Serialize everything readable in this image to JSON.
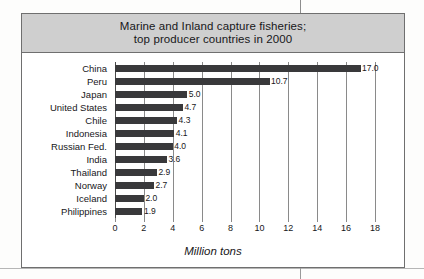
{
  "figure": {
    "title_line1": "Marine and Inland capture fisheries;",
    "title_line2": "top producer countries in 2000",
    "frame_color": "#6f6f6f",
    "title_band_color": "#cfcfcf",
    "bar_color": "#39393b"
  },
  "chart_data": {
    "type": "bar",
    "orientation": "horizontal",
    "title": "Marine and Inland capture fisheries; top producer countries in 2000",
    "xlabel": "Million tons",
    "ylabel": "",
    "categories": [
      "China",
      "Peru",
      "Japan",
      "United States",
      "Chile",
      "Indonesia",
      "Russian Fed.",
      "India",
      "Thailand",
      "Norway",
      "Iceland",
      "Philippines"
    ],
    "values": [
      17.0,
      10.7,
      5.0,
      4.7,
      4.3,
      4.1,
      4.0,
      3.6,
      2.9,
      2.7,
      2.0,
      1.9
    ],
    "value_labels": [
      "17.0",
      "10.7",
      "5.0",
      "4.7",
      "4.3",
      "4.1",
      "4.0",
      "3.6",
      "2.9",
      "2.7",
      "2.0",
      "1.9"
    ],
    "xlim": [
      0,
      18
    ],
    "xticks": [
      0,
      2,
      4,
      6,
      8,
      10,
      12,
      14,
      16,
      18
    ],
    "xtick_labels": [
      "0",
      "2",
      "4",
      "6",
      "8",
      "10",
      "12",
      "14",
      "16",
      "18"
    ],
    "grid": "vertical",
    "legend": null
  }
}
